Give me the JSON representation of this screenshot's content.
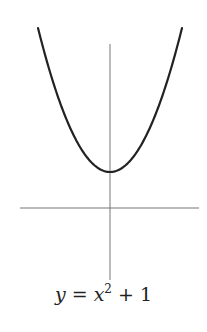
{
  "chart_data": {
    "type": "line",
    "title": "",
    "caption": "y = x^2 + 1",
    "caption_parts": {
      "lhs": "y",
      "eq": " = ",
      "var": "x",
      "exp": "2",
      "rest": " + 1"
    },
    "function": "y = x^2 + 1",
    "series": [
      {
        "name": "y = x^2 + 1",
        "x": [
          -2,
          -1.5,
          -1,
          -0.5,
          0,
          0.5,
          1,
          1.5,
          2
        ],
        "values": [
          5,
          3.25,
          2,
          1.25,
          1,
          1.25,
          2,
          3.25,
          5
        ]
      }
    ],
    "xlabel": "",
    "ylabel": "",
    "xlim": [
      -2.5,
      2.5
    ],
    "ylim": [
      -2,
      4.5
    ],
    "grid": false,
    "legend": "none",
    "axes": {
      "x_axis_at": 0,
      "y_axis_at": 0,
      "ticks": false
    },
    "colors": {
      "curve": "#222222",
      "axes": "#777777"
    }
  }
}
